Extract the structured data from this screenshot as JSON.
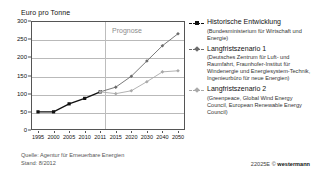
{
  "chart_data": {
    "type": "line",
    "title": "",
    "ylabel": "Euro pro Tonne",
    "xlabel": "",
    "ylim": [
      0,
      300
    ],
    "yticks": [
      0,
      50,
      100,
      150,
      200,
      250,
      300
    ],
    "categories": [
      "1995",
      "2000",
      "2005",
      "2010",
      "2011",
      "2015",
      "2020",
      "2030",
      "2040",
      "2050"
    ],
    "grid": true,
    "legend_position": "right",
    "annotations": [
      {
        "text": "Prognose",
        "x": "2011-2050",
        "note": "forecast region label above divider"
      }
    ],
    "series": [
      {
        "name": "Historische Entwicklung",
        "source": "(Bundesministerium für Wirtschaft und Energie)",
        "color": "#111111",
        "marker": "square",
        "x": [
          "1995",
          "2000",
          "2005",
          "2010",
          "2011"
        ],
        "values": [
          50,
          50,
          72,
          87,
          105
        ]
      },
      {
        "name": "Langfristszenario 1",
        "source": "(Deutsches Zentrum für Luft- und Raumfahrt, Fraunhofer-Institut für Windenergie und Energiesystem-Technik, Ingenieurbüro für neue Energien)",
        "color": "#6b6b6b",
        "marker": "diamond",
        "x": [
          "2011",
          "2015",
          "2020",
          "2030",
          "2040",
          "2050"
        ],
        "values": [
          105,
          118,
          148,
          190,
          232,
          265
        ]
      },
      {
        "name": "Langfristszenario 2",
        "source": "(Greenpeace, Global Wind Energy Council, European Renewable Energy Council)",
        "color": "#a9a9a9",
        "marker": "diamond",
        "x": [
          "2011",
          "2015",
          "2020",
          "2030",
          "2040",
          "2050"
        ],
        "values": [
          105,
          100,
          108,
          133,
          160,
          163
        ]
      }
    ]
  },
  "axis": {
    "y_title": "Euro pro Tonne",
    "y_ticks": [
      "300",
      "250",
      "200",
      "150",
      "100",
      "50",
      "0"
    ],
    "x_ticks": [
      "1995",
      "2000",
      "2005",
      "2010",
      "2011",
      "2015",
      "2020",
      "2030",
      "2040",
      "2050"
    ]
  },
  "plot": {
    "prognose_label": "Prognose"
  },
  "legend": {
    "items": [
      {
        "label": "Historische Entwicklung",
        "sub": "(Bundesministerium für Wirtschaft und Energie)",
        "color": "#111111"
      },
      {
        "label": "Langfristszenario 1",
        "sub": "(Deutsches Zentrum für Luft- und Raumfahrt, Fraunhofer-Institut für Windenergie und Energiesystem-Technik, Ingenieurbüro für neue Energien)",
        "color": "#6b6b6b"
      },
      {
        "label": "Langfristszenario 2",
        "sub": "(Greenpeace, Global Wind Energy Council, European Renewable Energy Council)",
        "color": "#a9a9a9"
      }
    ]
  },
  "footer": {
    "source_line1": "Quelle: Agentur für Erneuerbare Energien",
    "source_line2": "Stand: 8/2012",
    "code": "22025E",
    "copyright": "©",
    "brand": "westermann"
  }
}
